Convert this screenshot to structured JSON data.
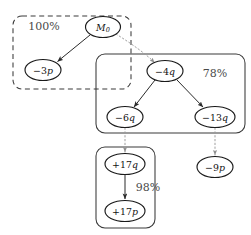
{
  "diagram": {
    "type": "hierarchical-graph",
    "width": 251,
    "height": 235,
    "background_color": "#ffffff",
    "node_stroke_color": "#1a1a1a",
    "cluster_stroke_color": "#3a3a3a",
    "solid_edge_color": "#2a2a2a",
    "dotted_edge_color": "#9a9a9a",
    "label_color": "#4a4a4a"
  },
  "clusters": [
    {
      "id": "cluster-root",
      "border_style": "dashed",
      "label": "100%",
      "label_x": 44,
      "label_y": 26,
      "x": 13,
      "y": 16,
      "width": 118,
      "height": 73,
      "radius": 9
    },
    {
      "id": "cluster-middle",
      "border_style": "solid",
      "label": "78%",
      "label_x": 215,
      "label_y": 73,
      "x": 96,
      "y": 54,
      "width": 149,
      "height": 79,
      "radius": 9
    },
    {
      "id": "cluster-bottom",
      "border_style": "solid",
      "label": "98%",
      "label_x": 148,
      "label_y": 187,
      "x": 96,
      "y": 147,
      "width": 59,
      "height": 81,
      "radius": 9
    }
  ],
  "nodes": [
    {
      "id": "node-m0",
      "label": "M0",
      "base": "M",
      "subscript": "0",
      "sign": "",
      "cx": 103,
      "cy": 27,
      "rx": 17.5,
      "ry": 10.5
    },
    {
      "id": "node-minus3p",
      "label": "-3p",
      "base": "p",
      "subscript": "",
      "sign": "−3",
      "cx": 43,
      "cy": 70,
      "rx": 18,
      "ry": 10.5
    },
    {
      "id": "node-minus4q",
      "label": "-4q",
      "base": "q",
      "subscript": "",
      "sign": "−4",
      "cx": 165,
      "cy": 71,
      "rx": 18,
      "ry": 10.5
    },
    {
      "id": "node-minus6q",
      "label": "-6q",
      "base": "q",
      "subscript": "",
      "sign": "−6",
      "cx": 125,
      "cy": 117,
      "rx": 18,
      "ry": 10.5
    },
    {
      "id": "node-minus13q",
      "label": "-13q",
      "base": "q",
      "subscript": "",
      "sign": "−13",
      "cx": 215,
      "cy": 117,
      "rx": 20,
      "ry": 10.5
    },
    {
      "id": "node-minus9p",
      "label": "-9p",
      "base": "p",
      "subscript": "",
      "sign": "−9",
      "cx": 215,
      "cy": 167,
      "rx": 18,
      "ry": 10.5
    },
    {
      "id": "node-plus17q",
      "label": "+17q",
      "base": "q",
      "subscript": "",
      "sign": "+17",
      "cx": 125,
      "cy": 164,
      "rx": 20,
      "ry": 10.5
    },
    {
      "id": "node-plus17p",
      "label": "+17p",
      "base": "p",
      "subscript": "",
      "sign": "+17",
      "cx": 125,
      "cy": 211,
      "rx": 20,
      "ry": 10.5
    }
  ],
  "edges": [
    {
      "id": "edge-m0-to-minus3p",
      "from": "node-m0",
      "to": "node-minus3p",
      "style": "solid",
      "arrow": true
    },
    {
      "id": "edge-m0-to-minus4q",
      "from": "node-m0",
      "to": "node-minus4q",
      "style": "dotted",
      "arrow": true
    },
    {
      "id": "edge-minus4q-to-minus6q",
      "from": "node-minus4q",
      "to": "node-minus6q",
      "style": "solid",
      "arrow": true
    },
    {
      "id": "edge-minus4q-to-minus13q",
      "from": "node-minus4q",
      "to": "node-minus13q",
      "style": "solid",
      "arrow": true
    },
    {
      "id": "edge-minus6q-to-plus17q",
      "from": "node-minus6q",
      "to": "node-plus17q",
      "style": "dotted",
      "arrow": true
    },
    {
      "id": "edge-minus13q-to-minus9p",
      "from": "node-minus13q",
      "to": "node-minus9p",
      "style": "dotted",
      "arrow": true
    },
    {
      "id": "edge-plus17q-to-plus17p",
      "from": "node-plus17q",
      "to": "node-plus17p",
      "style": "solid",
      "arrow": true
    }
  ]
}
